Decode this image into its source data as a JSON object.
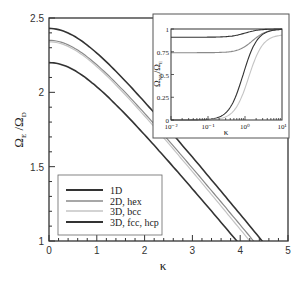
{
  "chart_data": [
    {
      "type": "line",
      "title": "",
      "xlabel": "κ",
      "ylabel": "Ω_E / Ω_D",
      "xlim": [
        0,
        5
      ],
      "ylim": [
        1,
        2.5
      ],
      "xticks": [
        "0",
        "1",
        "2",
        "3",
        "4",
        "5"
      ],
      "yticks": [
        "1",
        "1.5",
        "2",
        "2.5"
      ],
      "grid": false,
      "legend_position": "lower-left",
      "series": [
        {
          "name": "1D",
          "color": "#333333",
          "width": 1.6,
          "y_at_0": 2.43,
          "x_at_y1": 4.46
        },
        {
          "name": "2D, hex",
          "color": "#8a8a8a",
          "width": 1.2,
          "y_at_0": 2.35,
          "x_at_y1": 4.28
        },
        {
          "name": "3D, bcc",
          "color": "#c4c4c4",
          "width": 1.2,
          "y_at_0": 2.34,
          "x_at_y1": 4.2
        },
        {
          "name": "3D, fcc, hcp",
          "color": "#333333",
          "width": 1.6,
          "y_at_0": 2.2,
          "x_at_y1": 3.93
        }
      ]
    },
    {
      "type": "line",
      "title": "inset",
      "xlabel": "κ",
      "ylabel": "Ω_NN / Ω_E",
      "xscale": "log",
      "xlim": [
        0.01,
        10
      ],
      "ylim": [
        0,
        1
      ],
      "xticks": [
        "10⁻²",
        "10⁻¹",
        "10⁰",
        "10¹"
      ],
      "yticks": [
        "0",
        "0.25",
        "0.5",
        "0.75",
        "1"
      ],
      "series": [
        {
          "name": "upper dark",
          "color": "#333333",
          "low": 0.91,
          "high": 1.0,
          "mid_log": 0.0
        },
        {
          "name": "upper gray",
          "color": "#8a8a8a",
          "low": 0.74,
          "high": 1.0,
          "mid_log": 0.2
        },
        {
          "name": "lower dark",
          "color": "#333333",
          "low": 0.0,
          "high": 1.0,
          "mid_log": -0.05
        },
        {
          "name": "lower gray",
          "color": "#c4c4c4",
          "low": 0.0,
          "high": 0.94,
          "mid_log": 0.1
        }
      ]
    }
  ],
  "labels": {
    "xlabel": "κ",
    "ylabel_main": "Ω",
    "ylabel_sub1": "E",
    "ylabel_sep": " /Ω",
    "ylabel_sub2": "D",
    "inset_ylabel_main": "Ω",
    "inset_ylabel_sub1": "NN",
    "inset_ylabel_sep": "/Ω",
    "inset_ylabel_sub2": "E",
    "inset_xlabel": "κ"
  },
  "legend": [
    "1D",
    "2D, hex",
    "3D, bcc",
    "3D, fcc, hcp"
  ]
}
